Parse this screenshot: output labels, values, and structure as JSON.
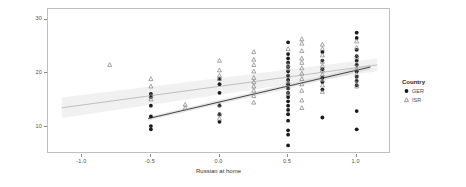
{
  "chart_data": {
    "type": "scatter",
    "title": "",
    "xlabel": "Russian at home",
    "ylabel": "Noun task (Russian)",
    "xlim": [
      -1.25,
      1.25
    ],
    "ylim": [
      5,
      32
    ],
    "xticks": [
      -1.0,
      -0.5,
      0.0,
      0.5,
      1.0
    ],
    "xtick_labels": [
      "-1.0",
      "-0.5",
      "0.0",
      "0.5",
      "1.0"
    ],
    "yticks": [
      10,
      20,
      30
    ],
    "ytick_labels": [
      "10",
      "20",
      "30"
    ],
    "grid": false,
    "legend_position": "right",
    "legend_title": "Country",
    "series": [
      {
        "name": "GER",
        "marker": "circle",
        "color": "#1a1a1a",
        "points": [
          [
            -0.5,
            14.0
          ],
          [
            -0.5,
            12.0
          ],
          [
            -0.5,
            10.2
          ],
          [
            -0.5,
            9.6
          ],
          [
            -0.5,
            15.6
          ],
          [
            -0.5,
            16.2
          ],
          [
            0.0,
            19.0
          ],
          [
            0.0,
            18.0
          ],
          [
            0.0,
            16.4
          ],
          [
            0.0,
            14.0
          ],
          [
            0.0,
            12.4
          ],
          [
            0.0,
            11.0
          ],
          [
            0.5,
            25.8
          ],
          [
            0.5,
            23.6
          ],
          [
            0.5,
            22.8
          ],
          [
            0.5,
            22.0
          ],
          [
            0.5,
            21.2
          ],
          [
            0.5,
            20.4
          ],
          [
            0.5,
            19.6
          ],
          [
            0.5,
            18.8
          ],
          [
            0.5,
            18.0
          ],
          [
            0.5,
            17.2
          ],
          [
            0.5,
            16.4
          ],
          [
            0.5,
            15.6
          ],
          [
            0.5,
            14.8
          ],
          [
            0.5,
            14.0
          ],
          [
            0.5,
            13.2
          ],
          [
            0.5,
            12.4
          ],
          [
            0.5,
            11.2
          ],
          [
            0.5,
            9.4
          ],
          [
            0.5,
            8.6
          ],
          [
            0.5,
            6.6
          ],
          [
            0.75,
            24.0
          ],
          [
            0.75,
            22.4
          ],
          [
            0.75,
            20.8
          ],
          [
            0.75,
            19.2
          ],
          [
            0.75,
            18.4
          ],
          [
            0.75,
            17.0
          ],
          [
            0.75,
            11.8
          ],
          [
            1.0,
            27.6
          ],
          [
            1.0,
            26.6
          ],
          [
            1.0,
            24.4
          ],
          [
            1.0,
            23.2
          ],
          [
            1.0,
            22.4
          ],
          [
            1.0,
            21.6
          ],
          [
            1.0,
            20.4
          ],
          [
            1.0,
            19.4
          ],
          [
            1.0,
            18.6
          ],
          [
            1.0,
            17.8
          ],
          [
            1.0,
            13.0
          ],
          [
            1.0,
            9.6
          ]
        ]
      },
      {
        "name": "ISR",
        "marker": "triangle",
        "color": "#808080",
        "points": [
          [
            -0.8,
            21.6
          ],
          [
            -0.5,
            19.0
          ],
          [
            -0.5,
            17.6
          ],
          [
            -0.5,
            15.8
          ],
          [
            -0.5,
            15.2
          ],
          [
            -0.25,
            14.2
          ],
          [
            -0.25,
            13.6
          ],
          [
            0.0,
            22.4
          ],
          [
            0.0,
            20.6
          ],
          [
            0.0,
            19.6
          ],
          [
            0.0,
            19.0
          ],
          [
            0.0,
            14.2
          ],
          [
            0.0,
            12.4
          ],
          [
            0.0,
            11.6
          ],
          [
            0.25,
            24.0
          ],
          [
            0.25,
            22.6
          ],
          [
            0.25,
            21.6
          ],
          [
            0.25,
            20.4
          ],
          [
            0.25,
            19.2
          ],
          [
            0.25,
            18.4
          ],
          [
            0.25,
            17.6
          ],
          [
            0.25,
            16.8
          ],
          [
            0.25,
            15.8
          ],
          [
            0.25,
            14.6
          ],
          [
            0.5,
            24.6
          ],
          [
            0.5,
            21.6
          ],
          [
            0.5,
            20.8
          ],
          [
            0.5,
            19.6
          ],
          [
            0.5,
            18.4
          ],
          [
            0.5,
            17.4
          ],
          [
            0.5,
            16.2
          ],
          [
            0.6,
            26.4
          ],
          [
            0.6,
            25.6
          ],
          [
            0.6,
            24.2
          ],
          [
            0.6,
            22.8
          ],
          [
            0.6,
            22.0
          ],
          [
            0.6,
            21.0
          ],
          [
            0.6,
            20.0
          ],
          [
            0.6,
            19.0
          ],
          [
            0.6,
            18.0
          ],
          [
            0.6,
            16.8
          ],
          [
            0.6,
            15.0
          ],
          [
            0.6,
            13.6
          ],
          [
            0.75,
            25.4
          ],
          [
            0.75,
            24.6
          ],
          [
            0.75,
            23.4
          ],
          [
            0.75,
            22.2
          ],
          [
            0.75,
            21.4
          ],
          [
            0.75,
            20.6
          ],
          [
            0.75,
            19.8
          ],
          [
            0.75,
            18.8
          ],
          [
            0.75,
            17.8
          ],
          [
            0.75,
            16.6
          ],
          [
            1.0,
            26.0
          ],
          [
            1.0,
            24.8
          ],
          [
            1.0,
            23.0
          ],
          [
            1.0,
            21.8
          ],
          [
            1.0,
            20.8
          ],
          [
            1.0,
            19.8
          ],
          [
            1.0,
            18.8
          ],
          [
            1.0,
            17.6
          ]
        ]
      }
    ],
    "fits": [
      {
        "name": "GER",
        "color": "#333333",
        "band_color": "#c8c8c8",
        "x_start": -0.52,
        "x_end": 1.1,
        "y_start": 11.6,
        "y_end": 21.2,
        "band_halfwidth_start": 0.35,
        "band_halfwidth_end": 0.45
      },
      {
        "name": "ISR",
        "color": "#b3b3b3",
        "band_color": "#e0e0e0",
        "x_start": -1.15,
        "x_end": 1.15,
        "y_start": 13.6,
        "y_end": 21.6,
        "band_halfwidth_start": 1.9,
        "band_halfwidth_end": 1.2
      }
    ]
  },
  "legend": {
    "title": "Country",
    "entries": [
      {
        "label": "GER",
        "marker": "circle",
        "color": "#1a1a1a"
      },
      {
        "label": "ISR",
        "marker": "triangle",
        "color": "#808080"
      }
    ]
  }
}
